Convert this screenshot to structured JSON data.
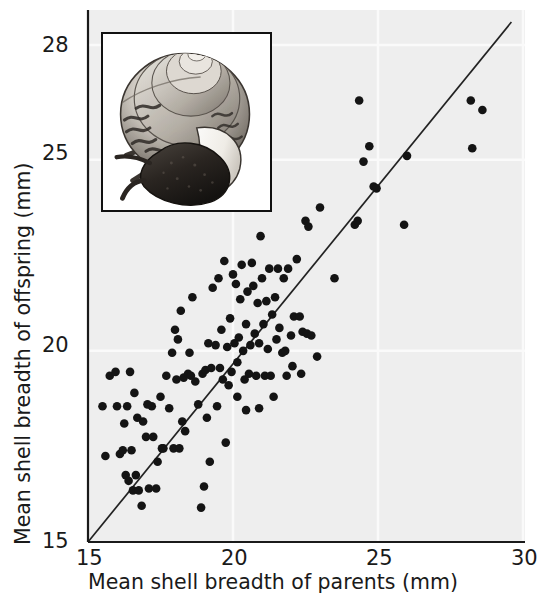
{
  "figure": {
    "background_color": "#ffffff",
    "plot_background_color": "#eeeeee",
    "point_color": "#141414",
    "line_color": "#222222",
    "gridline_color": "#fafafa",
    "axis_color": "#1a1a1a"
  },
  "axes": {
    "x_title": "Mean shell breadth of parents (mm)",
    "y_title": "Mean shell breadth of offspring (mm)",
    "x_ticks": [
      "15",
      "20",
      "25",
      "30"
    ],
    "y_ticks": [
      "28",
      "25",
      "20",
      "15"
    ]
  },
  "inset": {
    "name": "snail-illustration",
    "caption": ""
  },
  "chart_data": {
    "type": "scatter",
    "title": "",
    "xlabel": "Mean shell breadth of parents (mm)",
    "ylabel": "Mean shell breadth of offspring (mm)",
    "xlim": [
      15,
      30
    ],
    "ylim": [
      15,
      28
    ],
    "xticks": [
      15,
      20,
      25,
      30
    ],
    "yticks": [
      15,
      20,
      25,
      28
    ],
    "grid": true,
    "legend": null,
    "reference_line": {
      "name": "regression-line",
      "description": "straight fitted line rising left-to-right",
      "x": [
        15.0,
        29.6
      ],
      "y": [
        15.0,
        28.6
      ]
    },
    "series": [
      {
        "name": "snail families",
        "marker": "filled-circle",
        "color": "#141414",
        "points": [
          [
            15.5,
            18.55
          ],
          [
            15.6,
            17.25
          ],
          [
            15.75,
            19.35
          ],
          [
            15.95,
            19.45
          ],
          [
            16.0,
            18.55
          ],
          [
            16.1,
            17.3
          ],
          [
            16.25,
            18.1
          ],
          [
            16.3,
            16.75
          ],
          [
            16.35,
            18.55
          ],
          [
            16.4,
            16.6
          ],
          [
            16.5,
            17.4
          ],
          [
            16.55,
            16.35
          ],
          [
            16.6,
            18.9
          ],
          [
            16.65,
            16.75
          ],
          [
            16.7,
            18.25
          ],
          [
            16.75,
            16.35
          ],
          [
            16.85,
            15.95
          ],
          [
            16.9,
            18.15
          ],
          [
            17.0,
            17.75
          ],
          [
            17.1,
            16.4
          ],
          [
            17.2,
            18.55
          ],
          [
            17.25,
            17.75
          ],
          [
            17.4,
            17.1
          ],
          [
            17.5,
            18.8
          ],
          [
            17.55,
            17.45
          ],
          [
            17.7,
            19.35
          ],
          [
            17.8,
            18.5
          ],
          [
            17.9,
            19.95
          ],
          [
            17.95,
            17.45
          ],
          [
            18.0,
            20.55
          ],
          [
            18.05,
            19.25
          ],
          [
            18.1,
            20.3
          ],
          [
            18.2,
            21.05
          ],
          [
            18.3,
            19.3
          ],
          [
            18.35,
            17.9
          ],
          [
            18.45,
            19.4
          ],
          [
            18.5,
            19.95
          ],
          [
            18.55,
            19.35
          ],
          [
            18.6,
            21.4
          ],
          [
            18.7,
            19.2
          ],
          [
            18.8,
            18.6
          ],
          [
            18.9,
            15.9
          ],
          [
            18.95,
            19.4
          ],
          [
            19.0,
            16.45
          ],
          [
            19.05,
            19.5
          ],
          [
            19.1,
            18.25
          ],
          [
            19.15,
            20.2
          ],
          [
            19.25,
            19.55
          ],
          [
            19.3,
            21.65
          ],
          [
            19.4,
            20.15
          ],
          [
            19.5,
            21.9
          ],
          [
            19.55,
            19.55
          ],
          [
            19.6,
            20.55
          ],
          [
            19.65,
            19.25
          ],
          [
            19.7,
            22.35
          ],
          [
            19.8,
            20.1
          ],
          [
            19.85,
            19.1
          ],
          [
            19.9,
            20.85
          ],
          [
            19.95,
            19.45
          ],
          [
            20.0,
            22.0
          ],
          [
            20.05,
            20.2
          ],
          [
            20.1,
            21.75
          ],
          [
            20.15,
            19.7
          ],
          [
            20.2,
            20.35
          ],
          [
            20.25,
            21.35
          ],
          [
            20.3,
            22.25
          ],
          [
            20.35,
            20.0
          ],
          [
            20.4,
            19.25
          ],
          [
            20.45,
            20.7
          ],
          [
            20.5,
            21.55
          ],
          [
            20.55,
            19.4
          ],
          [
            20.6,
            20.15
          ],
          [
            20.65,
            22.3
          ],
          [
            20.7,
            21.7
          ],
          [
            20.75,
            20.45
          ],
          [
            20.8,
            19.35
          ],
          [
            20.85,
            21.25
          ],
          [
            20.9,
            20.2
          ],
          [
            20.95,
            23.0
          ],
          [
            21.0,
            21.9
          ],
          [
            21.05,
            20.7
          ],
          [
            21.1,
            19.35
          ],
          [
            21.15,
            21.3
          ],
          [
            21.2,
            20.05
          ],
          [
            21.25,
            22.15
          ],
          [
            21.3,
            19.35
          ],
          [
            21.35,
            20.95
          ],
          [
            21.4,
            18.8
          ],
          [
            21.45,
            21.4
          ],
          [
            21.5,
            20.3
          ],
          [
            21.55,
            22.15
          ],
          [
            21.6,
            20.6
          ],
          [
            21.7,
            19.95
          ],
          [
            21.75,
            21.9
          ],
          [
            21.8,
            20.0
          ],
          [
            21.9,
            22.15
          ],
          [
            22.0,
            20.4
          ],
          [
            22.05,
            19.6
          ],
          [
            22.1,
            20.9
          ],
          [
            22.2,
            22.4
          ],
          [
            22.3,
            20.9
          ],
          [
            22.4,
            20.5
          ],
          [
            22.5,
            23.4
          ],
          [
            22.55,
            20.45
          ],
          [
            22.6,
            23.25
          ],
          [
            22.7,
            20.4
          ],
          [
            22.9,
            19.85
          ],
          [
            23.0,
            23.75
          ],
          [
            23.5,
            21.9
          ],
          [
            24.2,
            23.3
          ],
          [
            24.3,
            23.4
          ],
          [
            24.35,
            26.55
          ],
          [
            24.5,
            24.95
          ],
          [
            24.7,
            25.35
          ],
          [
            24.85,
            24.3
          ],
          [
            24.95,
            24.25
          ],
          [
            25.9,
            23.3
          ],
          [
            26.0,
            25.1
          ],
          [
            28.2,
            26.55
          ],
          [
            28.25,
            25.3
          ],
          [
            28.6,
            26.3
          ],
          [
            16.45,
            19.45
          ],
          [
            17.35,
            16.4
          ],
          [
            17.6,
            17.45
          ],
          [
            18.25,
            18.15
          ],
          [
            19.45,
            18.55
          ],
          [
            19.75,
            17.6
          ],
          [
            20.45,
            18.45
          ],
          [
            20.9,
            18.5
          ],
          [
            21.85,
            19.35
          ],
          [
            22.35,
            19.4
          ],
          [
            16.2,
            17.4
          ],
          [
            17.05,
            18.6
          ],
          [
            18.15,
            17.45
          ],
          [
            19.2,
            17.1
          ],
          [
            20.15,
            18.8
          ]
        ]
      }
    ]
  }
}
